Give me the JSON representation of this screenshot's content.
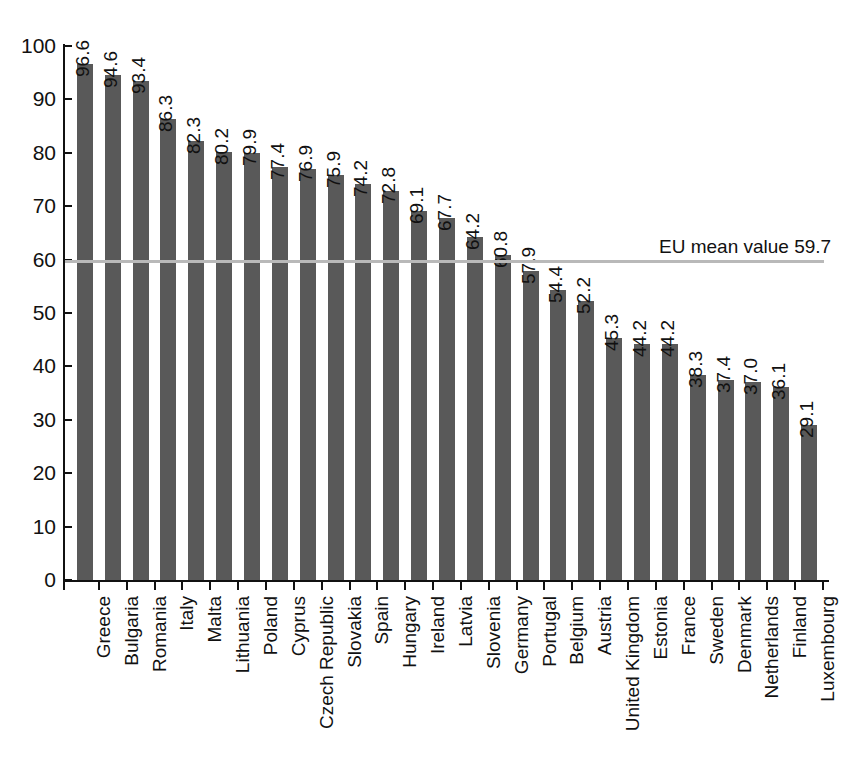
{
  "chart_data": {
    "type": "bar",
    "title": "",
    "subtitle": "",
    "xlabel": "",
    "ylabel": "",
    "ylim": [
      0,
      100
    ],
    "y_ticks": [
      0,
      10,
      20,
      30,
      40,
      50,
      60,
      70,
      80,
      90,
      100
    ],
    "grid": false,
    "legend": false,
    "orientation": "vertical",
    "bar_color": "#595959",
    "value_label_rotation": 90,
    "category_label_rotation": 90,
    "categories": [
      "Greece",
      "Bulgaria",
      "Romania",
      "Italy",
      "Malta",
      "Lithuania",
      "Poland",
      "Cyprus",
      "Czech Republic",
      "Slovakia",
      "Spain",
      "Hungary",
      "Ireland",
      "Latvia",
      "Slovenia",
      "Germany",
      "Portugal",
      "Belgium",
      "Austria",
      "United Kingdom",
      "Estonia",
      "France",
      "Sweden",
      "Denmark",
      "Netherlands",
      "Finland",
      "Luxembourg"
    ],
    "values": [
      96.6,
      94.6,
      93.4,
      86.3,
      82.3,
      80.2,
      79.9,
      77.4,
      76.9,
      75.9,
      74.2,
      72.8,
      69.1,
      67.7,
      64.2,
      60.8,
      57.9,
      54.4,
      52.2,
      45.3,
      44.2,
      44.2,
      38.3,
      37.4,
      37.0,
      36.1,
      29.1
    ],
    "value_labels": [
      "96.6",
      "94.6",
      "93.4",
      "86.3",
      "82.3",
      "80.2",
      "79.9",
      "77.4",
      "76.9",
      "75.9",
      "74.2",
      "72.8",
      "69.1",
      "67.7",
      "64.2",
      "60.8",
      "57.9",
      "54.4",
      "52.2",
      "45.3",
      "44.2",
      "44.2",
      "38.3",
      "37.4",
      "37.0",
      "36.1",
      "29.1"
    ],
    "reference_line": {
      "label": "EU mean value 59.7",
      "value": 59.7,
      "color": "#b9b9b9"
    }
  }
}
